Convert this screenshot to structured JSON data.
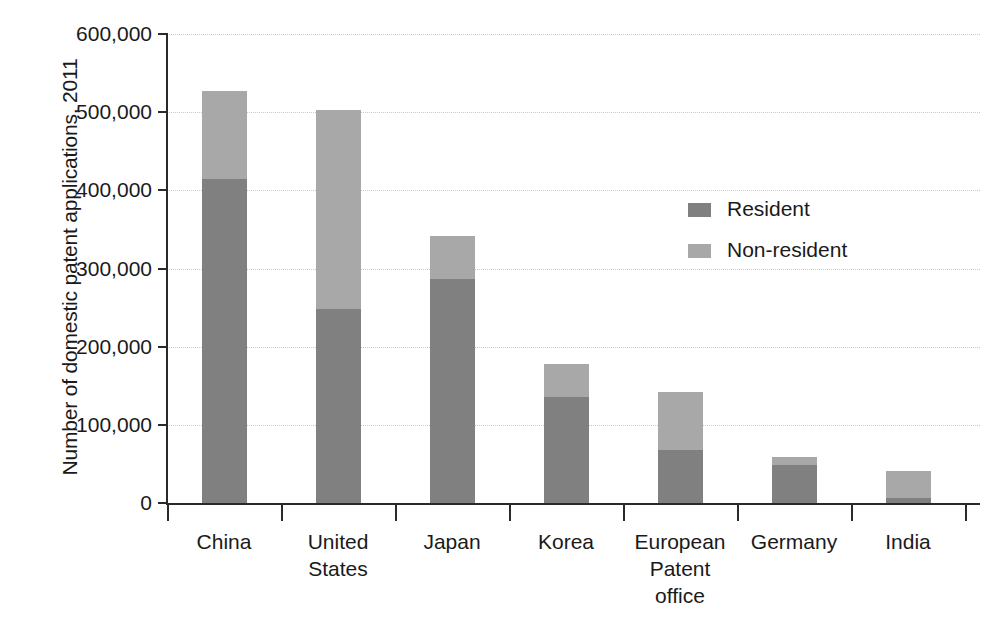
{
  "chart_data": {
    "type": "bar",
    "subtype": "stacked-vertical",
    "title": "",
    "xlabel": "",
    "ylabel": "Number of domestic patent applications, 2011",
    "ylim": [
      0,
      600000
    ],
    "yticks": [
      0,
      100000,
      200000,
      300000,
      400000,
      500000,
      600000
    ],
    "ytick_labels": [
      "0",
      "100,000",
      "200,000",
      "300,000",
      "400,000",
      "500,000",
      "600,000"
    ],
    "grid": true,
    "grid_axis": "y",
    "legend_position": "inside-upper-right",
    "categories": [
      "China",
      "United States",
      "Japan",
      "Korea",
      "European Patent office",
      "Germany",
      "India"
    ],
    "category_label_lines": [
      [
        "China"
      ],
      [
        "United",
        "States"
      ],
      [
        "Japan"
      ],
      [
        "Korea"
      ],
      [
        "European",
        "Patent",
        "office"
      ],
      [
        "Germany"
      ],
      [
        "India"
      ]
    ],
    "series": [
      {
        "name": "Resident",
        "color": "#808080",
        "values": [
          415000,
          248000,
          287000,
          135000,
          68000,
          48000,
          6000
        ]
      },
      {
        "name": "Non-resident",
        "color": "#a8a8a8",
        "values": [
          112000,
          255000,
          55000,
          43000,
          74000,
          11000,
          35000
        ]
      }
    ],
    "totals": [
      527000,
      503000,
      342000,
      178000,
      142000,
      59000,
      41000
    ]
  },
  "legend": {
    "items": [
      {
        "label": "Resident",
        "color": "#808080"
      },
      {
        "label": "Non-resident",
        "color": "#a8a8a8"
      }
    ]
  },
  "colors": {
    "resident": "#808080",
    "non_resident": "#a8a8a8",
    "axis": "#2a2a2a",
    "gridline": "#c9c9c9",
    "background": "#ffffff",
    "text": "#1a1a1a"
  }
}
